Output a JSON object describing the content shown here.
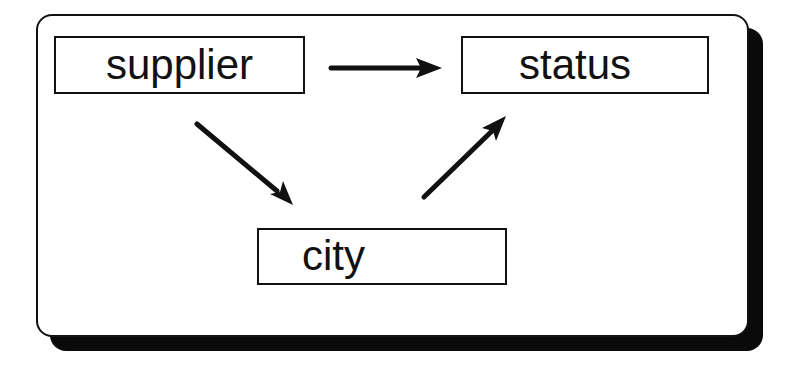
{
  "diagram": {
    "nodes": [
      {
        "id": "supplier",
        "label": "supplier"
      },
      {
        "id": "status",
        "label": "status"
      },
      {
        "id": "city",
        "label": "city"
      }
    ],
    "edges": [
      {
        "from": "supplier",
        "to": "status"
      },
      {
        "from": "supplier",
        "to": "city"
      },
      {
        "from": "city",
        "to": "status"
      }
    ]
  },
  "colors": {
    "ink": "#111111",
    "shadow": "#0a0a0a",
    "background": "#ffffff"
  }
}
